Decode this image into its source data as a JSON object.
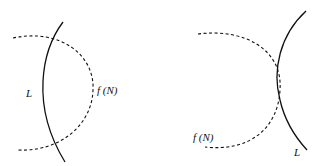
{
  "diagram": {
    "panels": [
      {
        "id": "left",
        "curve_solid_label": "L",
        "curve_dashed_label": "f (N)",
        "relation": "L intersects f(N) at two points"
      },
      {
        "id": "right",
        "curve_solid_label": "L",
        "curve_dashed_label": "f (N)",
        "relation": "L tangent to f(N) at one point"
      }
    ],
    "colors": {
      "stroke": "#111111",
      "background": "#ffffff"
    }
  }
}
